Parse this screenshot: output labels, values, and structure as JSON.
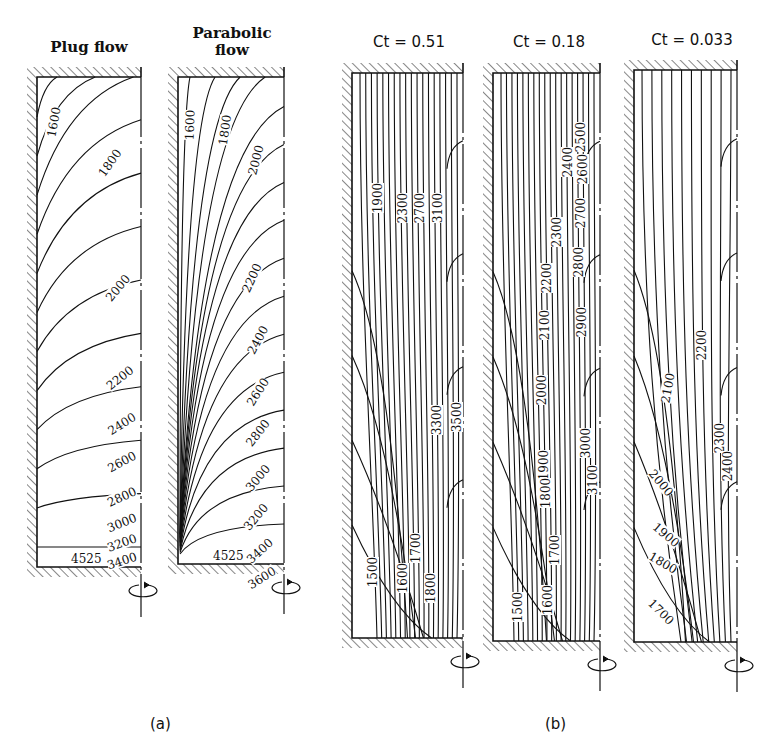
{
  "figure": {
    "part_a_label": "(a)",
    "part_b_label": "(b)"
  },
  "panels": [
    {
      "id": "plug",
      "title_lines": [
        "Plug flow"
      ],
      "title_sans": false,
      "box": {
        "x": 37,
        "y": 77,
        "w": 104,
        "h": 490
      },
      "bottom_label": "4525",
      "labels": [
        {
          "text": "1600",
          "x": 54,
          "y": 122,
          "rot": -80
        },
        {
          "text": "1800",
          "x": 110,
          "y": 163,
          "rot": -55
        },
        {
          "text": "2000",
          "x": 118,
          "y": 288,
          "rot": -50
        },
        {
          "text": "2200",
          "x": 120,
          "y": 378,
          "rot": -38
        },
        {
          "text": "2400",
          "x": 122,
          "y": 424,
          "rot": -32
        },
        {
          "text": "2600",
          "x": 122,
          "y": 462,
          "rot": -28
        },
        {
          "text": "2800",
          "x": 122,
          "y": 497,
          "rot": -25
        },
        {
          "text": "3000",
          "x": 122,
          "y": 523,
          "rot": -22
        },
        {
          "text": "3200",
          "x": 122,
          "y": 543,
          "rot": -20
        },
        {
          "text": "3400",
          "x": 122,
          "y": 561,
          "rot": -18
        }
      ]
    },
    {
      "id": "parabolic",
      "title_lines": [
        "Parabolic",
        "flow"
      ],
      "title_sans": false,
      "box": {
        "x": 178,
        "y": 77,
        "w": 106,
        "h": 487
      },
      "bottom_label": "4525",
      "labels": [
        {
          "text": "1600",
          "x": 190,
          "y": 125,
          "rot": -88
        },
        {
          "text": "1800",
          "x": 225,
          "y": 130,
          "rot": -82
        },
        {
          "text": "2000",
          "x": 256,
          "y": 160,
          "rot": -75
        },
        {
          "text": "2200",
          "x": 252,
          "y": 278,
          "rot": -65
        },
        {
          "text": "2400",
          "x": 258,
          "y": 340,
          "rot": -62
        },
        {
          "text": "2600",
          "x": 258,
          "y": 392,
          "rot": -58
        },
        {
          "text": "2800",
          "x": 258,
          "y": 433,
          "rot": -52
        },
        {
          "text": "3000",
          "x": 258,
          "y": 478,
          "rot": -50
        },
        {
          "text": "3200",
          "x": 256,
          "y": 517,
          "rot": -50
        },
        {
          "text": "3400",
          "x": 260,
          "y": 551,
          "rot": -42
        },
        {
          "text": "3600",
          "x": 262,
          "y": 578,
          "rot": -32
        }
      ]
    },
    {
      "id": "ct051",
      "title_lines": [
        "Ct = 0.51"
      ],
      "title_sans": true,
      "box": {
        "x": 352,
        "y": 73,
        "w": 111,
        "h": 565
      },
      "bottom_label": "",
      "labels": [
        {
          "text": "1900",
          "x": 378,
          "y": 198,
          "rot": -90
        },
        {
          "text": "2300",
          "x": 403,
          "y": 208,
          "rot": -90
        },
        {
          "text": "2700",
          "x": 420,
          "y": 208,
          "rot": -90
        },
        {
          "text": "3100",
          "x": 438,
          "y": 208,
          "rot": -90
        },
        {
          "text": "3300",
          "x": 437,
          "y": 420,
          "rot": -90
        },
        {
          "text": "3500",
          "x": 457,
          "y": 417,
          "rot": -90
        },
        {
          "text": "1500",
          "x": 373,
          "y": 572,
          "rot": -90
        },
        {
          "text": "1600",
          "x": 403,
          "y": 578,
          "rot": -90
        },
        {
          "text": "1700",
          "x": 416,
          "y": 548,
          "rot": -90
        },
        {
          "text": "1800",
          "x": 431,
          "y": 588,
          "rot": -90
        }
      ]
    },
    {
      "id": "ct018",
      "title_lines": [
        "Ct = 0.18"
      ],
      "title_sans": true,
      "box": {
        "x": 493,
        "y": 73,
        "w": 107,
        "h": 568
      },
      "bottom_label": "",
      "labels": [
        {
          "text": "2500",
          "x": 581,
          "y": 137,
          "rot": -90
        },
        {
          "text": "2400",
          "x": 568,
          "y": 162,
          "rot": -90
        },
        {
          "text": "2600",
          "x": 583,
          "y": 169,
          "rot": -90
        },
        {
          "text": "2300",
          "x": 557,
          "y": 232,
          "rot": -90
        },
        {
          "text": "2700",
          "x": 581,
          "y": 213,
          "rot": -90
        },
        {
          "text": "2200",
          "x": 547,
          "y": 278,
          "rot": -90
        },
        {
          "text": "2800",
          "x": 579,
          "y": 262,
          "rot": -90
        },
        {
          "text": "2100",
          "x": 545,
          "y": 325,
          "rot": -90
        },
        {
          "text": "2900",
          "x": 582,
          "y": 322,
          "rot": -90
        },
        {
          "text": "2000",
          "x": 542,
          "y": 390,
          "rot": -90
        },
        {
          "text": "3000",
          "x": 586,
          "y": 443,
          "rot": -90
        },
        {
          "text": "1900",
          "x": 544,
          "y": 465,
          "rot": -90
        },
        {
          "text": "3100",
          "x": 593,
          "y": 480,
          "rot": -90
        },
        {
          "text": "1800",
          "x": 546,
          "y": 493,
          "rot": -90
        },
        {
          "text": "1700",
          "x": 555,
          "y": 550,
          "rot": -90
        },
        {
          "text": "1600",
          "x": 548,
          "y": 600,
          "rot": -90
        },
        {
          "text": "1500",
          "x": 518,
          "y": 607,
          "rot": -90
        }
      ]
    },
    {
      "id": "ct0033",
      "title_lines": [
        "Ct = 0.033"
      ],
      "title_sans": true,
      "box": {
        "x": 634,
        "y": 70,
        "w": 103,
        "h": 572
      },
      "bottom_label": "",
      "labels": [
        {
          "text": "2200",
          "x": 702,
          "y": 345,
          "rot": -90
        },
        {
          "text": "2100",
          "x": 668,
          "y": 388,
          "rot": -80
        },
        {
          "text": "2300",
          "x": 720,
          "y": 438,
          "rot": -90
        },
        {
          "text": "2400",
          "x": 728,
          "y": 466,
          "rot": -90
        },
        {
          "text": "2000",
          "x": 661,
          "y": 483,
          "rot": 50
        },
        {
          "text": "1900",
          "x": 666,
          "y": 535,
          "rot": 40
        },
        {
          "text": "1800",
          "x": 663,
          "y": 563,
          "rot": 30
        },
        {
          "text": "1700",
          "x": 661,
          "y": 612,
          "rot": 45
        }
      ]
    }
  ],
  "chart_data": {
    "type": "contour",
    "panels": [
      {
        "name": "Plug flow",
        "group": "(a)",
        "contour_levels": [
          1600,
          1800,
          2000,
          2200,
          2400,
          2600,
          2800,
          3000,
          3200,
          3400
        ],
        "bottom_wall_value": 4525
      },
      {
        "name": "Parabolic flow",
        "group": "(a)",
        "contour_levels": [
          1600,
          1800,
          2000,
          2200,
          2400,
          2600,
          2800,
          3000,
          3200,
          3400,
          3600
        ],
        "bottom_wall_value": 4525
      },
      {
        "name": "Ct = 0.51",
        "group": "(b)",
        "contour_levels": [
          1500,
          1600,
          1700,
          1800,
          1900,
          2300,
          2700,
          3100,
          3300,
          3500
        ]
      },
      {
        "name": "Ct = 0.18",
        "group": "(b)",
        "contour_levels": [
          1500,
          1600,
          1700,
          1800,
          1900,
          2000,
          2100,
          2200,
          2300,
          2400,
          2500,
          2600,
          2700,
          2800,
          2900,
          3000,
          3100
        ]
      },
      {
        "name": "Ct = 0.033",
        "group": "(b)",
        "contour_levels": [
          1700,
          1800,
          1900,
          2000,
          2100,
          2200,
          2300,
          2400
        ]
      }
    ]
  }
}
